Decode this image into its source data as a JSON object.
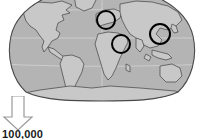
{
  "figure": {
    "name": "world-map-with-highlight-circles",
    "background_color": "#ffffff"
  },
  "map": {
    "name": "world-map",
    "projection": "robinson",
    "ocean_color": "#b4b4b4",
    "land_color": "#c8c8c8",
    "outline_color": "#4a4a4a",
    "graticule_color": "#d8d8d8",
    "clipped_top": true,
    "continent_labels": [
      "North America",
      "South America",
      "Europe",
      "Africa",
      "Asia",
      "Australia",
      "Antarctica"
    ]
  },
  "highlight_circles": {
    "name": "region-highlight-circles",
    "stroke_color": "#000000",
    "stroke_width": 2,
    "fill": "none",
    "items": [
      {
        "label": "Europe",
        "cx": 106,
        "cy": 20,
        "r": 9
      },
      {
        "label": "East Africa / Middle East",
        "cx": 121,
        "cy": 44,
        "r": 9
      },
      {
        "label": "East Asia",
        "cx": 160,
        "cy": 34,
        "r": 10
      }
    ]
  },
  "arrow": {
    "name": "down-arrow",
    "direction": "down",
    "fill_color": "#ffffff",
    "stroke_color": "#9a9a9a"
  },
  "scale": {
    "name": "scale-value",
    "value": "100,000"
  }
}
